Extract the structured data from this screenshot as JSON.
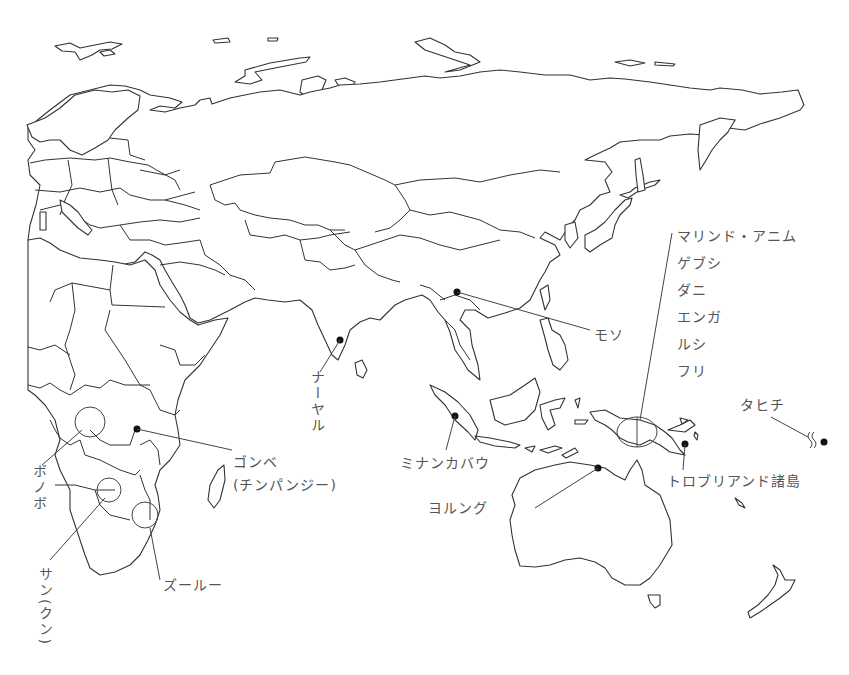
{
  "map": {
    "type": "outline map",
    "region": "Africa, Europe, Asia, Oceania",
    "colors": {
      "line": "#333333",
      "label": "#555555",
      "marker": "#111111",
      "background": "#ffffff"
    }
  },
  "labels": {
    "mosuo": "モソ",
    "nayar": "ナーヤル",
    "gombe_line1": "ゴンベ",
    "gombe_line2": "(チンパンジー)",
    "bonobo": "ボノボ",
    "san": "サン(クン)",
    "zulu": "ズールー",
    "minangkabau": "ミナンカバウ",
    "yolngu": "ヨルング",
    "trobriand": "トロブリアンド諸島",
    "tahiti": "タヒチ",
    "new_guinea_group": [
      "マリンド・アニム",
      "ゲブシ",
      "ダニ",
      "エンガ",
      "ルシ",
      "フリ"
    ]
  },
  "markers": [
    {
      "name": "mosuo",
      "x": 457,
      "y": 292,
      "type": "dot"
    },
    {
      "name": "nayar",
      "x": 340,
      "y": 340,
      "type": "dot"
    },
    {
      "name": "gombe",
      "x": 137,
      "y": 429,
      "type": "dot"
    },
    {
      "name": "minangkabau",
      "x": 455,
      "y": 416,
      "type": "dot"
    },
    {
      "name": "yolngu",
      "x": 598,
      "y": 468,
      "type": "dot"
    },
    {
      "name": "trobriand",
      "x": 685,
      "y": 444,
      "type": "dot"
    },
    {
      "name": "tahiti",
      "x": 824,
      "y": 442,
      "type": "dot"
    },
    {
      "name": "bonobo",
      "x": 90,
      "y": 422,
      "type": "circle"
    },
    {
      "name": "san",
      "x": 109,
      "y": 490,
      "type": "circle"
    },
    {
      "name": "zulu",
      "x": 145,
      "y": 515,
      "type": "circle"
    },
    {
      "name": "new_guinea",
      "x": 636,
      "y": 433,
      "type": "ellipse"
    }
  ]
}
